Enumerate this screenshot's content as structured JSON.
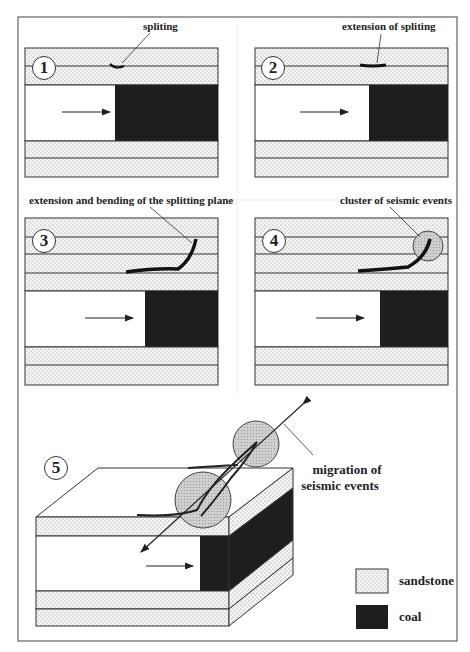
{
  "figure": {
    "panels": [
      {
        "number": "1",
        "label": "spliting"
      },
      {
        "number": "2",
        "label": "extension of spliting"
      },
      {
        "number": "3",
        "label": "extension and bending of the splitting plane"
      },
      {
        "number": "4",
        "label": "cluster of seismic events"
      },
      {
        "number": "5",
        "label_line1": "migration of",
        "label_line2": "seismic events"
      }
    ],
    "legend": [
      {
        "label": "sandstone",
        "pattern": "dotted"
      },
      {
        "label": "coal",
        "pattern": "solid-dark"
      }
    ],
    "colors": {
      "coal": "#1e1e1e",
      "sandstone_bg": "#f4f4f4",
      "cluster": "#c8c8c8",
      "line": "#333333"
    }
  }
}
